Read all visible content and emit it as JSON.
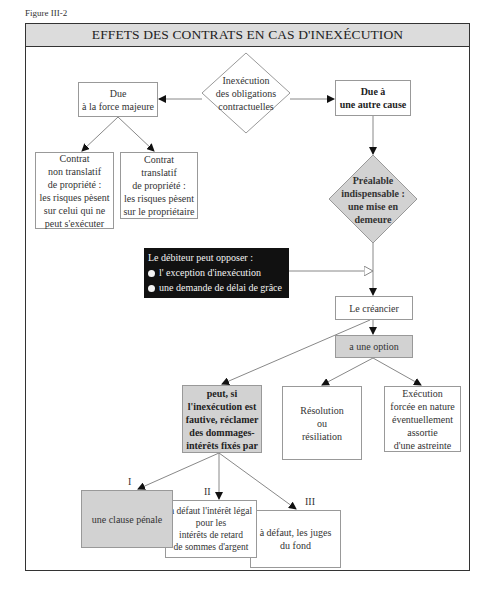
{
  "figure_label": "Figure III-2",
  "title": "EFFETS DES CONTRATS EN CAS D'INEXÉCUTION",
  "nodes": {
    "inexecution": "Inexécution\ndes obligations\ncontractuelles",
    "force_majeure": "Due\nà la force majeure",
    "autre_cause": "Due à\nune autre cause",
    "non_translatif": "Contrat\nnon translatif\nde propriété :\nles risques pèsent\nsur celui qui ne\npeut s'exécuter",
    "translatif": "Contrat\ntranslatif\nde propriété :\nles risques pèsent\nsur le propriétaire",
    "mise_en_demeure": "Préalable\nindispensable :\nune mise en\ndemeure",
    "debiteur": {
      "title": "Le débiteur peut opposer :",
      "items": [
        "l' exception d'inexécution",
        "une demande de délai de grâce"
      ]
    },
    "creancier": "Le créancier",
    "option": "a une option",
    "dommages": "peut, si\nl'inexécution est\nfautive, réclamer\ndes dommages-\nintérêts fixés par",
    "resolution": "Résolution\nou\nrésiliation",
    "execution_forcee": "Exécution\nforcée en nature\néventuellement\nassortie\nd'une astreinte",
    "clause_penale": "une clause pénale",
    "interet_legal": "à défaut l'intérêt légal\npour les\nintérêts de retard\nde sommes d'argent",
    "juges": "à défaut, les juges\ndu fond"
  },
  "roman_labels": [
    "I",
    "II",
    "III"
  ],
  "colors": {
    "header_bg": "#dcdcdc",
    "gray_box": "#d2d2d2",
    "black_box": "#111111",
    "line": "#888888"
  }
}
